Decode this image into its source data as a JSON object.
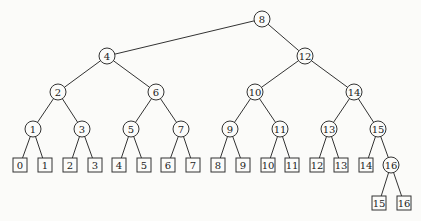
{
  "diagram": {
    "type": "binary-search-tree",
    "internal_nodes": [
      {
        "id": "n8",
        "label": "8",
        "x": 262,
        "y": 19
      },
      {
        "id": "n4",
        "label": "4",
        "x": 107,
        "y": 56
      },
      {
        "id": "n12",
        "label": "12",
        "x": 305,
        "y": 56
      },
      {
        "id": "n2",
        "label": "2",
        "x": 58,
        "y": 92
      },
      {
        "id": "n6",
        "label": "6",
        "x": 156,
        "y": 92
      },
      {
        "id": "n10",
        "label": "10",
        "x": 255,
        "y": 92
      },
      {
        "id": "n14",
        "label": "14",
        "x": 354,
        "y": 92
      },
      {
        "id": "n1",
        "label": "1",
        "x": 33,
        "y": 129
      },
      {
        "id": "n3",
        "label": "3",
        "x": 82,
        "y": 129
      },
      {
        "id": "n5",
        "label": "5",
        "x": 131,
        "y": 129
      },
      {
        "id": "n7",
        "label": "7",
        "x": 181,
        "y": 129
      },
      {
        "id": "n9",
        "label": "9",
        "x": 230,
        "y": 129
      },
      {
        "id": "n11",
        "label": "11",
        "x": 280,
        "y": 129
      },
      {
        "id": "n13",
        "label": "13",
        "x": 329,
        "y": 129
      },
      {
        "id": "n15",
        "label": "15",
        "x": 378,
        "y": 129
      },
      {
        "id": "n16",
        "label": "16",
        "x": 391,
        "y": 165
      }
    ],
    "leaves": [
      {
        "id": "l0",
        "label": "0",
        "x": 20,
        "y": 165
      },
      {
        "id": "l1",
        "label": "1",
        "x": 45,
        "y": 165
      },
      {
        "id": "l2",
        "label": "2",
        "x": 70,
        "y": 165
      },
      {
        "id": "l3",
        "label": "3",
        "x": 95,
        "y": 165
      },
      {
        "id": "l4",
        "label": "4",
        "x": 119,
        "y": 165
      },
      {
        "id": "l5",
        "label": "5",
        "x": 144,
        "y": 165
      },
      {
        "id": "l6",
        "label": "6",
        "x": 168,
        "y": 165
      },
      {
        "id": "l7",
        "label": "7",
        "x": 193,
        "y": 165
      },
      {
        "id": "l8",
        "label": "8",
        "x": 218,
        "y": 165
      },
      {
        "id": "l9",
        "label": "9",
        "x": 243,
        "y": 165
      },
      {
        "id": "l10",
        "label": "10",
        "x": 268,
        "y": 165
      },
      {
        "id": "l11",
        "label": "11",
        "x": 292,
        "y": 165
      },
      {
        "id": "l12",
        "label": "12",
        "x": 317,
        "y": 165
      },
      {
        "id": "l13",
        "label": "13",
        "x": 341,
        "y": 165
      },
      {
        "id": "l14",
        "label": "14",
        "x": 366,
        "y": 165
      },
      {
        "id": "l15",
        "label": "15",
        "x": 379,
        "y": 203
      },
      {
        "id": "l16",
        "label": "16",
        "x": 404,
        "y": 203
      }
    ],
    "edges": [
      [
        "n8",
        "n4"
      ],
      [
        "n8",
        "n12"
      ],
      [
        "n4",
        "n2"
      ],
      [
        "n4",
        "n6"
      ],
      [
        "n12",
        "n10"
      ],
      [
        "n12",
        "n14"
      ],
      [
        "n2",
        "n1"
      ],
      [
        "n2",
        "n3"
      ],
      [
        "n6",
        "n5"
      ],
      [
        "n6",
        "n7"
      ],
      [
        "n10",
        "n9"
      ],
      [
        "n10",
        "n11"
      ],
      [
        "n14",
        "n13"
      ],
      [
        "n14",
        "n15"
      ],
      [
        "n1",
        "l0"
      ],
      [
        "n1",
        "l1"
      ],
      [
        "n3",
        "l2"
      ],
      [
        "n3",
        "l3"
      ],
      [
        "n5",
        "l4"
      ],
      [
        "n5",
        "l5"
      ],
      [
        "n7",
        "l6"
      ],
      [
        "n7",
        "l7"
      ],
      [
        "n9",
        "l8"
      ],
      [
        "n9",
        "l9"
      ],
      [
        "n11",
        "l10"
      ],
      [
        "n11",
        "l11"
      ],
      [
        "n13",
        "l12"
      ],
      [
        "n13",
        "l13"
      ],
      [
        "n15",
        "l14"
      ],
      [
        "n15",
        "n16"
      ],
      [
        "n16",
        "l15"
      ],
      [
        "n16",
        "l16"
      ]
    ],
    "style": {
      "line_color": "#333333",
      "background": "#fbfbf9",
      "node_radius": 8,
      "leaf_size": 14
    }
  }
}
